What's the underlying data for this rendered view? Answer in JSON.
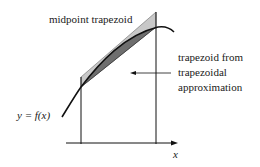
{
  "diagram": {
    "labels": {
      "midpoint": "midpoint trapezoid",
      "trap_line1": "trapezoid from",
      "trap_line2": "trapezoidal",
      "trap_line3": "approximation",
      "function": "y = f(x)",
      "axis_x": "x"
    },
    "colors": {
      "midpoint_fill": "#c8c8c8",
      "trapezoid_fill": "#6e6e6e",
      "stroke": "#111111",
      "text": "#1a1a1a"
    }
  }
}
